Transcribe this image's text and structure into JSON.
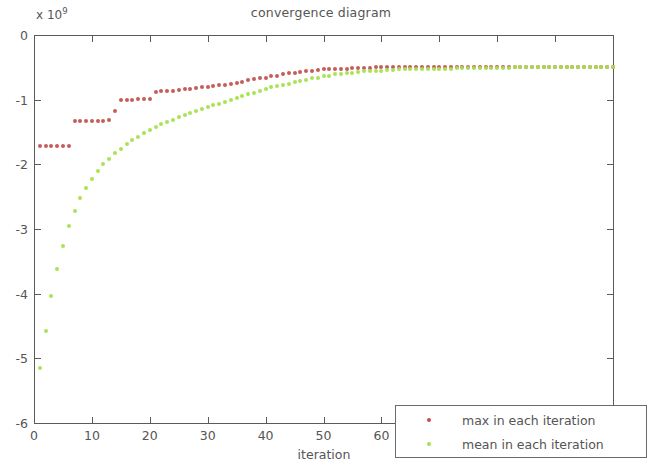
{
  "chart_data": {
    "type": "scatter",
    "title": "convergence diagram",
    "xlabel": "iteration",
    "ylabel": "",
    "y_exponent_label": "x 10",
    "y_exponent_power": "9",
    "xlim": [
      0,
      100
    ],
    "ylim": [
      -6,
      0
    ],
    "xticks": [
      0,
      10,
      20,
      30,
      40,
      50,
      60,
      70,
      80,
      90,
      100
    ],
    "xticklabels": [
      "0",
      "10",
      "20",
      "30",
      "40",
      "50",
      "60",
      "70",
      "80",
      "90",
      "100"
    ],
    "yticks": [
      0,
      -1,
      -2,
      -3,
      -4,
      -5,
      -6
    ],
    "yticklabels": [
      "0",
      "-1",
      "-2",
      "-3",
      "-4",
      "-5",
      "-6"
    ],
    "grid": false,
    "legend_position": "lower right",
    "y_units": "1e9",
    "series": [
      {
        "name": "max in each iteration",
        "color": "#c0504d",
        "marker": "dot",
        "x": [
          1,
          2,
          3,
          4,
          5,
          6,
          7,
          8,
          9,
          10,
          11,
          12,
          13,
          14,
          15,
          16,
          17,
          18,
          19,
          20,
          21,
          22,
          23,
          24,
          25,
          26,
          27,
          28,
          29,
          30,
          31,
          32,
          33,
          34,
          35,
          36,
          37,
          38,
          39,
          40,
          41,
          42,
          43,
          44,
          45,
          46,
          47,
          48,
          49,
          50,
          51,
          52,
          53,
          54,
          55,
          56,
          57,
          58,
          59,
          60,
          61,
          62,
          63,
          64,
          65,
          66,
          67,
          68,
          69,
          70,
          71,
          72,
          73,
          74,
          75,
          76,
          77,
          78,
          79,
          80,
          81,
          82,
          83,
          84,
          85,
          86,
          87,
          88,
          89,
          90,
          91,
          92,
          93,
          94,
          95,
          96,
          97,
          98,
          99,
          100
        ],
        "values": [
          -1.72,
          -1.72,
          -1.72,
          -1.72,
          -1.72,
          -1.72,
          -1.33,
          -1.33,
          -1.33,
          -1.33,
          -1.33,
          -1.33,
          -1.32,
          -1.17,
          -1.0,
          -1.0,
          -1.0,
          -0.99,
          -0.99,
          -0.99,
          -0.88,
          -0.87,
          -0.86,
          -0.86,
          -0.85,
          -0.84,
          -0.83,
          -0.82,
          -0.81,
          -0.8,
          -0.79,
          -0.78,
          -0.77,
          -0.76,
          -0.74,
          -0.72,
          -0.7,
          -0.68,
          -0.67,
          -0.66,
          -0.64,
          -0.63,
          -0.61,
          -0.59,
          -0.58,
          -0.57,
          -0.56,
          -0.55,
          -0.54,
          -0.53,
          -0.53,
          -0.52,
          -0.52,
          -0.52,
          -0.51,
          -0.51,
          -0.51,
          -0.51,
          -0.5,
          -0.5,
          -0.5,
          -0.5,
          -0.5,
          -0.5,
          -0.5,
          -0.5,
          -0.5,
          -0.5,
          -0.5,
          -0.5,
          -0.5,
          -0.5,
          -0.5,
          -0.5,
          -0.5,
          -0.5,
          -0.5,
          -0.5,
          -0.5,
          -0.5,
          -0.5,
          -0.5,
          -0.5,
          -0.5,
          -0.5,
          -0.5,
          -0.5,
          -0.5,
          -0.5,
          -0.5,
          -0.5,
          -0.5,
          -0.5,
          -0.5,
          -0.5,
          -0.5,
          -0.5,
          -0.5,
          -0.5,
          -0.5
        ]
      },
      {
        "name": "mean in each iteration",
        "color": "#a6e24f",
        "marker": "dot",
        "x": [
          1,
          2,
          3,
          4,
          5,
          6,
          7,
          8,
          9,
          10,
          11,
          12,
          13,
          14,
          15,
          16,
          17,
          18,
          19,
          20,
          21,
          22,
          23,
          24,
          25,
          26,
          27,
          28,
          29,
          30,
          31,
          32,
          33,
          34,
          35,
          36,
          37,
          38,
          39,
          40,
          41,
          42,
          43,
          44,
          45,
          46,
          47,
          48,
          49,
          50,
          51,
          52,
          53,
          54,
          55,
          56,
          57,
          58,
          59,
          60,
          61,
          62,
          63,
          64,
          65,
          66,
          67,
          68,
          69,
          70,
          71,
          72,
          73,
          74,
          75,
          76,
          77,
          78,
          79,
          80,
          81,
          82,
          83,
          84,
          85,
          86,
          87,
          88,
          89,
          90,
          91,
          92,
          93,
          94,
          95,
          96,
          97,
          98,
          99,
          100
        ],
        "values": [
          -5.15,
          -4.57,
          -4.03,
          -3.62,
          -3.27,
          -2.96,
          -2.72,
          -2.52,
          -2.36,
          -2.22,
          -2.1,
          -2.0,
          -1.91,
          -1.83,
          -1.76,
          -1.69,
          -1.63,
          -1.57,
          -1.52,
          -1.47,
          -1.42,
          -1.38,
          -1.34,
          -1.31,
          -1.27,
          -1.24,
          -1.21,
          -1.18,
          -1.15,
          -1.12,
          -1.09,
          -1.06,
          -1.03,
          -1.0,
          -0.97,
          -0.94,
          -0.91,
          -0.89,
          -0.86,
          -0.84,
          -0.81,
          -0.79,
          -0.77,
          -0.75,
          -0.73,
          -0.71,
          -0.69,
          -0.67,
          -0.66,
          -0.64,
          -0.63,
          -0.61,
          -0.6,
          -0.59,
          -0.58,
          -0.57,
          -0.56,
          -0.56,
          -0.55,
          -0.55,
          -0.54,
          -0.54,
          -0.53,
          -0.53,
          -0.53,
          -0.53,
          -0.52,
          -0.52,
          -0.52,
          -0.52,
          -0.52,
          -0.52,
          -0.51,
          -0.51,
          -0.51,
          -0.51,
          -0.51,
          -0.51,
          -0.51,
          -0.51,
          -0.51,
          -0.51,
          -0.5,
          -0.5,
          -0.5,
          -0.5,
          -0.5,
          -0.5,
          -0.5,
          -0.5,
          -0.5,
          -0.5,
          -0.5,
          -0.5,
          -0.5,
          -0.5,
          -0.5,
          -0.5,
          -0.5,
          -0.5
        ]
      }
    ]
  },
  "legend": {
    "items": [
      {
        "label": "max in each iteration",
        "color": "#c0504d"
      },
      {
        "label": "mean in each iteration",
        "color": "#a6e24f"
      }
    ]
  },
  "colors": {
    "max_series": "#c0504d",
    "mean_series": "#a6e24f",
    "axis": "#5a5a5a",
    "text": "#555555",
    "background": "#ffffff"
  }
}
